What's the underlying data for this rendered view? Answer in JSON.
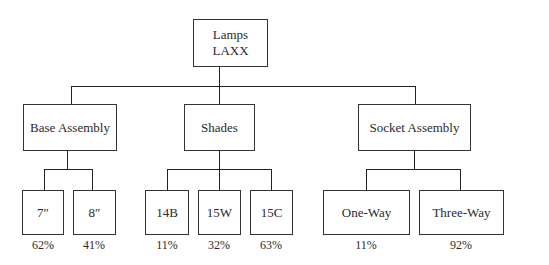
{
  "root": {
    "line1": "Lamps",
    "line2": "LAXX"
  },
  "groups": [
    {
      "label": "Base Assembly",
      "children": [
        {
          "label": "7″",
          "percent": "62%"
        },
        {
          "label": "8″",
          "percent": "41%"
        }
      ]
    },
    {
      "label": "Shades",
      "children": [
        {
          "label": "14B",
          "percent": "11%"
        },
        {
          "label": "15W",
          "percent": "32%"
        },
        {
          "label": "15C",
          "percent": "63%"
        }
      ]
    },
    {
      "label": "Socket Assembly",
      "children": [
        {
          "label": "One-Way",
          "percent": "11%"
        },
        {
          "label": "Three-Way",
          "percent": "92%"
        }
      ]
    }
  ]
}
